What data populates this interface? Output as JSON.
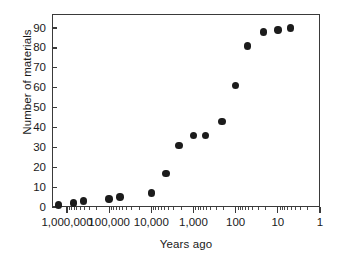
{
  "chart_data": {
    "type": "scatter",
    "title": "",
    "xlabel": "Years ago",
    "ylabel": "Number of materials",
    "x_scale": "log",
    "x_reversed": true,
    "xlim": [
      2000000,
      1
    ],
    "ylim": [
      0,
      95
    ],
    "grid": false,
    "legend": null,
    "x_tick_labels": [
      "1,000,000",
      "100,000",
      "10,000",
      "1,000",
      "100",
      "10",
      "1"
    ],
    "x_tick_values": [
      1000000,
      100000,
      10000,
      1000,
      100,
      10,
      1
    ],
    "y_tick_labels": [
      "0",
      "10",
      "20",
      "30",
      "40",
      "50",
      "60",
      "70",
      "80",
      "90"
    ],
    "y_tick_values": [
      0,
      10,
      20,
      30,
      40,
      50,
      60,
      70,
      80,
      90
    ],
    "points": [
      {
        "x": 1600000,
        "y": 1
      },
      {
        "x": 700000,
        "y": 2
      },
      {
        "x": 400000,
        "y": 3
      },
      {
        "x": 100000,
        "y": 4
      },
      {
        "x": 55000,
        "y": 5
      },
      {
        "x": 10000,
        "y": 7
      },
      {
        "x": 4500,
        "y": 17
      },
      {
        "x": 2200,
        "y": 31
      },
      {
        "x": 1000,
        "y": 36
      },
      {
        "x": 520,
        "y": 36
      },
      {
        "x": 210,
        "y": 43
      },
      {
        "x": 100,
        "y": 61
      },
      {
        "x": 52,
        "y": 81
      },
      {
        "x": 22,
        "y": 88
      },
      {
        "x": 10,
        "y": 89
      },
      {
        "x": 5,
        "y": 90
      }
    ],
    "point_color": "#1c1c1c",
    "axis_color": "#3a3a3a"
  }
}
